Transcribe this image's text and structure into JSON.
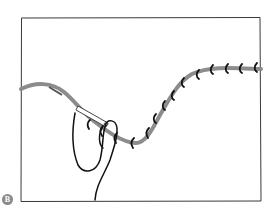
{
  "figure": {
    "step_label": "B",
    "colors": {
      "frame": "#3a3a3a",
      "seam_line": "#8c8c8c",
      "thread": "#111111",
      "needle": "#555555",
      "badge": "#8a8a8a",
      "background": "#ffffff"
    },
    "stitch_count": 14
  }
}
